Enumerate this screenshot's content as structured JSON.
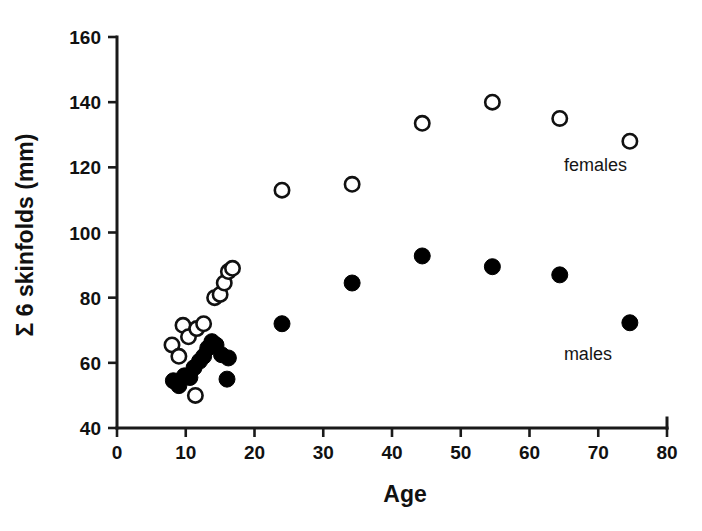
{
  "chart_data": {
    "type": "scatter",
    "title": "",
    "xlabel": "Age",
    "ylabel": "Σ 6 skinfolds (mm)",
    "xlim": [
      0,
      80
    ],
    "ylim": [
      40,
      160
    ],
    "xticks": [
      0,
      10,
      20,
      30,
      40,
      50,
      60,
      70,
      80
    ],
    "yticks": [
      40,
      60,
      80,
      100,
      120,
      140,
      160
    ],
    "grid": false,
    "legend_position": "inline-annotations",
    "series": [
      {
        "name": "females",
        "marker": "open-circle",
        "color": "#111111",
        "fill": "#ffffff",
        "points": [
          [
            8.0,
            65.5
          ],
          [
            9.0,
            62.0
          ],
          [
            9.6,
            71.5
          ],
          [
            10.4,
            68.0
          ],
          [
            11.4,
            50.0
          ],
          [
            11.6,
            70.5
          ],
          [
            12.6,
            72.0
          ],
          [
            14.2,
            80.0
          ],
          [
            15.0,
            81.0
          ],
          [
            15.6,
            84.5
          ],
          [
            16.2,
            88.0
          ],
          [
            16.8,
            89.0
          ],
          [
            24.0,
            113.0
          ],
          [
            34.2,
            114.8
          ],
          [
            44.4,
            133.5
          ],
          [
            54.6,
            140.0
          ],
          [
            64.4,
            135.0
          ],
          [
            74.6,
            128.0
          ]
        ]
      },
      {
        "name": "males",
        "marker": "filled-circle",
        "color": "#000000",
        "fill": "#000000",
        "points": [
          [
            8.2,
            54.5
          ],
          [
            9.0,
            53.0
          ],
          [
            9.8,
            56.0
          ],
          [
            10.6,
            55.5
          ],
          [
            11.2,
            58.5
          ],
          [
            12.0,
            60.5
          ],
          [
            12.6,
            62.0
          ],
          [
            13.2,
            64.5
          ],
          [
            13.8,
            66.5
          ],
          [
            14.4,
            65.5
          ],
          [
            15.2,
            62.5
          ],
          [
            16.2,
            61.5
          ],
          [
            16.0,
            55.0
          ],
          [
            24.0,
            72.0
          ],
          [
            34.2,
            84.5
          ],
          [
            44.4,
            92.8
          ],
          [
            54.6,
            89.5
          ],
          [
            64.4,
            87.0
          ],
          [
            74.6,
            72.3
          ]
        ]
      }
    ],
    "annotations": [
      {
        "text": "females",
        "x": 65.0,
        "y": 119.0
      },
      {
        "text": "males",
        "x": 65.0,
        "y": 61.0
      }
    ]
  }
}
